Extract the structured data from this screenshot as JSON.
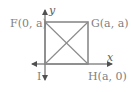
{
  "diagram": {
    "title": "",
    "axes": {
      "x_label": "x",
      "y_label": "y",
      "origin_label": "I"
    },
    "points": {
      "F": {
        "label": "F(0, a)",
        "coord": "(0, a)"
      },
      "G": {
        "label": "G(a, a)",
        "coord": "(a, a)"
      },
      "H": {
        "label": "H(a, 0)",
        "coord": "(a, 0)"
      },
      "I": {
        "label": "I",
        "coord": "(0, 0)"
      }
    },
    "shape": "square IFGH with both diagonals",
    "colors": {
      "line": "#8a8a8a",
      "text": "#808080",
      "axis": "#606060"
    }
  }
}
